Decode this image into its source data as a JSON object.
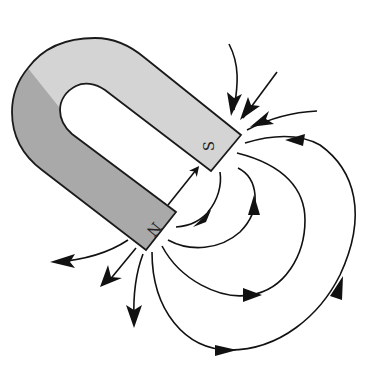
{
  "diagram": {
    "magnet": {
      "type": "horseshoe",
      "north_label": "N",
      "south_label": "S",
      "north_leg_color": "#a9a9a9",
      "south_leg_color": "#d4d4d4",
      "outline_color": "#1a1a1a"
    },
    "field_lines": {
      "color": "#111111",
      "direction": "from N pole to S pole",
      "outgoing_from_N_count": 3,
      "incoming_to_S_count": 3,
      "closed_loops_N_to_S_count": 5
    }
  }
}
